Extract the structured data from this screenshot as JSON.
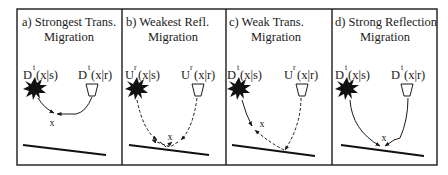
{
  "figure": {
    "panels": [
      {
        "id": "a",
        "title_line1": "a)  Strongest Trans.",
        "title_line2": "Migration",
        "source_label": {
          "base": "D",
          "sup": "t",
          "args": "(x|s)"
        },
        "receiver_label": {
          "base": "D",
          "sup": "t",
          "args": "(x|r)"
        },
        "path_style": "solid",
        "image_point_label": "x"
      },
      {
        "id": "b",
        "title_line1": "b)  Weakest Refl.",
        "title_line2": "Migration",
        "source_label": {
          "base": "U",
          "sup": "r",
          "args": "(x|s)"
        },
        "receiver_label": {
          "base": "U",
          "sup": "r",
          "args": "(x|r)"
        },
        "path_style": "dashed",
        "image_point_label": "x"
      },
      {
        "id": "c",
        "title_line1": "c)  Weak Trans.",
        "title_line2": "Migration",
        "source_label": {
          "base": "D",
          "sup": "t",
          "args": "(x|s)"
        },
        "receiver_label": {
          "base": "U",
          "sup": "r",
          "args": "(x|r)"
        },
        "path_style": "mixed",
        "image_point_label": "x"
      },
      {
        "id": "d",
        "title_line1": "d)  Strong Reflection",
        "title_line2": "Migration",
        "source_label": {
          "base": "D",
          "sup": "t",
          "args": "(x|s)"
        },
        "receiver_label": {
          "base": "D",
          "sup": "t",
          "args": "(x|r)"
        },
        "path_style": "solid",
        "image_point_label": "x"
      }
    ],
    "colors": {
      "ink": "#1a1a1a",
      "background": "#ffffff"
    }
  }
}
